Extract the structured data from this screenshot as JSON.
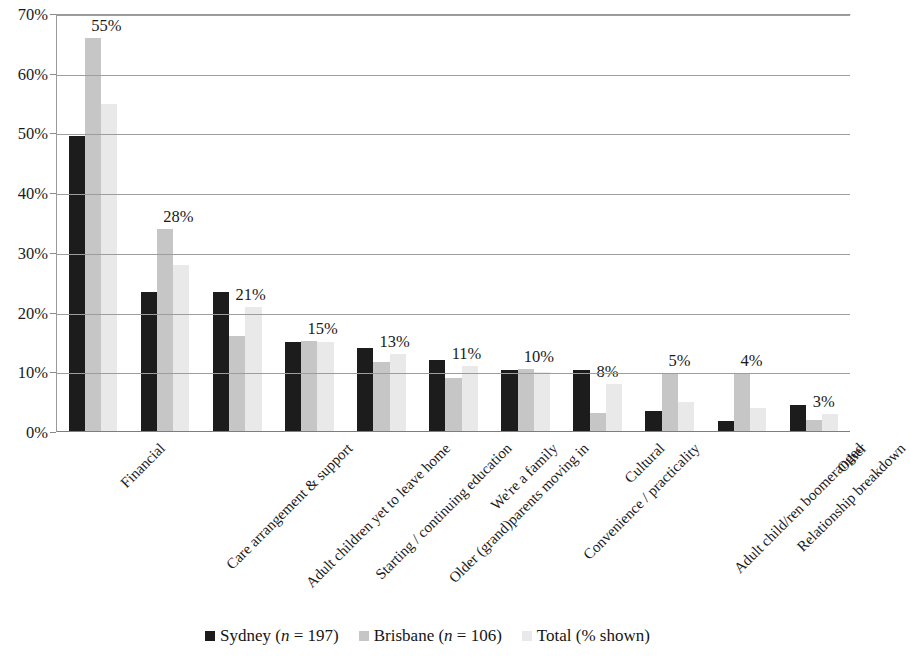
{
  "chart_data": {
    "type": "bar",
    "title": "",
    "xlabel": "",
    "ylabel": "",
    "ylim": [
      0,
      70
    ],
    "ytick_labels": [
      "70%",
      "60%",
      "50%",
      "40%",
      "30%",
      "20%",
      "10%",
      "0%"
    ],
    "ytick_values": [
      70,
      60,
      50,
      40,
      30,
      20,
      10,
      0
    ],
    "grid": true,
    "grid_axis": "y",
    "legend_position": "bottom",
    "orientation": "vertical",
    "value_labels_series": "Total (% shown)",
    "categories": [
      "Financial",
      "Care arrangement & support",
      "Adult children yet to leave home",
      "Starting / continuing education",
      "Older (grand)parents moving in",
      "We're a family",
      "Convenience / practicality",
      "Cultural",
      "Adult child/ren boomeranged",
      "Relationship breakdown",
      "Other"
    ],
    "series": [
      {
        "name": "Sydney (n = 197)",
        "color": "#1c1c1c",
        "values": [
          49.5,
          23.5,
          23.5,
          15.0,
          14.0,
          12.0,
          10.4,
          10.4,
          3.6,
          1.8,
          4.5
        ]
      },
      {
        "name": "Brisbane (n = 106)",
        "color": "#c6c6c6",
        "values": [
          66.0,
          34.0,
          16.0,
          15.2,
          11.7,
          9.0,
          10.5,
          3.2,
          9.8,
          9.8,
          2.0
        ]
      },
      {
        "name": "Total (% shown)",
        "color": "#e9e9e9",
        "values": [
          55.0,
          28.0,
          21.0,
          15.0,
          13.0,
          11.0,
          10.0,
          8.0,
          5.0,
          4.0,
          3.0
        ]
      }
    ],
    "data_labels": [
      "55%",
      "28%",
      "21%",
      "15%",
      "13%",
      "11%",
      "10%",
      "8%",
      "5%",
      "4%",
      "3%"
    ]
  },
  "legend": {
    "items": [
      {
        "label_prefix": "Sydney (",
        "label_italic": "n",
        "label_suffix": " = 197)",
        "color": "#1c1c1c"
      },
      {
        "label_prefix": "Brisbane (",
        "label_italic": "n",
        "label_suffix": " = 106)",
        "color": "#c6c6c6"
      },
      {
        "label_prefix": "Total (% shown)",
        "label_italic": "",
        "label_suffix": "",
        "color": "#e9e9e9"
      }
    ]
  }
}
